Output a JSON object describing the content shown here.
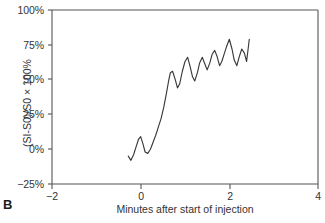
{
  "panel": {
    "label": "B"
  },
  "chart_data": {
    "type": "line",
    "title": "",
    "subtitle": "",
    "xlabel": "Minutes after start of injection",
    "ylabel": "(SI-S0)/S0 × 100%",
    "xlim": [
      -2,
      4
    ],
    "ylim": [
      -25,
      100
    ],
    "xticks": [
      -2,
      0,
      2,
      4
    ],
    "xtick_labels": [
      "−2",
      "0",
      "2",
      "4"
    ],
    "yticks": [
      -25,
      0,
      25,
      50,
      75,
      100
    ],
    "ytick_labels": [
      "−25%",
      "0%",
      "25%",
      "50%",
      "75%",
      "100%"
    ],
    "grid": false,
    "legend": null,
    "line_color": "#3a3a3a",
    "series": [
      {
        "name": "relative signal intensity",
        "x": [
          -0.28,
          -0.22,
          -0.16,
          -0.1,
          -0.05,
          0.0,
          0.05,
          0.1,
          0.16,
          0.22,
          0.28,
          0.34,
          0.4,
          0.46,
          0.52,
          0.58,
          0.63,
          0.67,
          0.72,
          0.78,
          0.83,
          0.88,
          0.94,
          1.0,
          1.06,
          1.11,
          1.17,
          1.22,
          1.28,
          1.33,
          1.39,
          1.45,
          1.5,
          1.56,
          1.61,
          1.67,
          1.72,
          1.78,
          1.83,
          1.89,
          1.94,
          2.0,
          2.06,
          2.11,
          2.17,
          2.22,
          2.28,
          2.34,
          2.39,
          2.45
        ],
        "y": [
          -5,
          -8,
          -4,
          2,
          7,
          9,
          4,
          -2,
          -3,
          0,
          5,
          10,
          16,
          22,
          30,
          40,
          49,
          55,
          56,
          50,
          44,
          47,
          56,
          63,
          66,
          60,
          52,
          49,
          55,
          62,
          66,
          61,
          57,
          62,
          68,
          71,
          67,
          60,
          63,
          69,
          74,
          79,
          72,
          64,
          60,
          66,
          72,
          69,
          63,
          79
        ]
      }
    ]
  }
}
